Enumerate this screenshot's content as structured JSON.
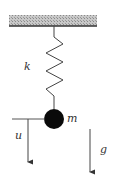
{
  "diagram": {
    "type": "spring-mass system",
    "labels": {
      "spring": "k",
      "mass": "m",
      "displacement": "u",
      "gravity": "g"
    },
    "colors": {
      "ceiling_fill": "#b8b8b8",
      "ceiling_line": "#333333",
      "stroke": "#444444",
      "mass": "#0a0a0a"
    }
  }
}
